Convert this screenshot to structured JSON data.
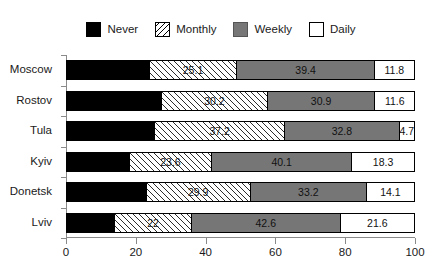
{
  "legend": {
    "entries": [
      {
        "label": "Never",
        "swatch": "never-swatch",
        "color": "#000000"
      },
      {
        "label": "Monthly",
        "swatch": "monthly-swatch",
        "color": "#ffffff"
      },
      {
        "label": "Weekly",
        "swatch": "weekly-swatch",
        "color": "#767676"
      },
      {
        "label": "Daily",
        "swatch": "daily-swatch",
        "color": "#ffffff"
      }
    ]
  },
  "chart_data": {
    "type": "bar",
    "orientation": "horizontal",
    "stacked": true,
    "stack_total": 100,
    "title": "",
    "xlabel": "",
    "ylabel": "",
    "xlim": [
      0,
      100
    ],
    "xticks": [
      0,
      20,
      40,
      60,
      80,
      100
    ],
    "xtick_labels": [
      "0",
      "20",
      "40",
      "60",
      "80",
      "100"
    ],
    "grid": false,
    "legend_position": "top-center",
    "categories": [
      "Moscow",
      "Rostov",
      "Tula",
      "Kyiv",
      "Donetsk",
      "Lviv"
    ],
    "series": [
      {
        "name": "Never",
        "values": [
          23.7,
          27.3,
          25.3,
          18.0,
          22.8,
          13.8
        ],
        "labels": [
          "",
          "",
          "",
          "",
          "",
          ""
        ]
      },
      {
        "name": "Monthly",
        "values": [
          25.1,
          30.2,
          37.2,
          23.6,
          29.9,
          22.0
        ],
        "labels": [
          "25.1",
          "30.2",
          "37.2",
          "23.6",
          "29.9",
          "22"
        ]
      },
      {
        "name": "Weekly",
        "values": [
          39.4,
          30.9,
          32.8,
          40.1,
          33.2,
          42.6
        ],
        "labels": [
          "39.4",
          "30.9",
          "32.8",
          "40.1",
          "33.2",
          "42.6"
        ]
      },
      {
        "name": "Daily",
        "values": [
          11.8,
          11.6,
          4.7,
          18.3,
          14.1,
          21.6
        ],
        "labels": [
          "11.8",
          "11.6",
          "4.7",
          "18.3",
          "14.1",
          "21.6"
        ]
      }
    ]
  }
}
